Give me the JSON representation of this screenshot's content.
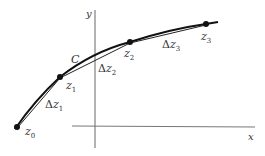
{
  "diagram": {
    "axes": {
      "x_label": "x",
      "y_label": "y"
    },
    "curve": {
      "label": "C"
    },
    "points": [
      {
        "name": "z",
        "sub": "0"
      },
      {
        "name": "z",
        "sub": "1"
      },
      {
        "name": "z",
        "sub": "2"
      },
      {
        "name": "z",
        "sub": "3"
      }
    ],
    "increments": [
      {
        "prefix": "Δ",
        "name": "z",
        "sub": "1"
      },
      {
        "prefix": "Δ",
        "name": "z",
        "sub": "2"
      },
      {
        "prefix": "Δ",
        "name": "z",
        "sub": "3"
      }
    ],
    "colors": {
      "curve": "#111111",
      "chord": "#222222",
      "axis": "#666666",
      "text": "#333333"
    }
  }
}
